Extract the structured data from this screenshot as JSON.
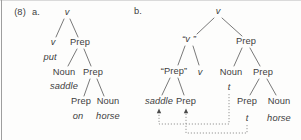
{
  "figure_label": {
    "text": "(8)",
    "x": 20,
    "y": 13
  },
  "colors": {
    "background": "#fdfdfc",
    "text": "#3e3e3e",
    "branch": "#6a6a6a",
    "movement_dotted": "#8a8a8a",
    "arrowhead": "#4a4a4a",
    "page_edge": "#9e9e9e",
    "top_edge": "#dadada"
  },
  "trees": [
    {
      "id": "a",
      "label": "a.",
      "label_x": 36,
      "label_y": 13,
      "nodes": [
        {
          "id": "v-root",
          "text": "v",
          "x": 67,
          "y": 13,
          "italic": true
        },
        {
          "id": "v-head",
          "text": "v",
          "x": 53,
          "y": 43,
          "italic": true
        },
        {
          "id": "prep-1",
          "text": "Prep",
          "x": 80,
          "y": 43,
          "italic": false
        },
        {
          "id": "put",
          "text": "put",
          "x": 50,
          "y": 58,
          "italic": true
        },
        {
          "id": "noun-1",
          "text": "Noun",
          "x": 64,
          "y": 73,
          "italic": false
        },
        {
          "id": "prep-2",
          "text": "Prep",
          "x": 93,
          "y": 73,
          "italic": false
        },
        {
          "id": "saddle",
          "text": "saddle",
          "x": 64,
          "y": 87,
          "italic": true
        },
        {
          "id": "prep-3",
          "text": "Prep",
          "x": 81,
          "y": 102,
          "italic": false
        },
        {
          "id": "noun-2",
          "text": "Noun",
          "x": 108,
          "y": 102,
          "italic": false
        },
        {
          "id": "on",
          "text": "on",
          "x": 78,
          "y": 117,
          "italic": true
        },
        {
          "id": "horse",
          "text": "horse",
          "x": 108,
          "y": 117,
          "italic": true
        }
      ],
      "edges": [
        [
          64,
          19,
          56,
          37
        ],
        [
          70,
          19,
          78,
          37
        ],
        [
          77,
          49,
          68,
          66
        ],
        [
          84,
          49,
          91,
          66
        ],
        [
          90,
          79,
          84,
          96
        ],
        [
          97,
          79,
          104,
          96
        ]
      ]
    },
    {
      "id": "b",
      "label": "b.",
      "label_x": 138,
      "label_y": 12,
      "nodes": [
        {
          "id": "v-root",
          "text": "v",
          "x": 218,
          "y": 12,
          "italic": true
        },
        {
          "id": "v-quoted",
          "text": "“v ”",
          "x": 189,
          "y": 40,
          "italic": true
        },
        {
          "id": "prep-top",
          "text": "Prep",
          "x": 246,
          "y": 42,
          "italic": false
        },
        {
          "id": "prep-quoted",
          "text": "“Prep”",
          "x": 174,
          "y": 72,
          "italic": false
        },
        {
          "id": "v-head",
          "text": "v",
          "x": 200,
          "y": 73,
          "italic": true
        },
        {
          "id": "noun-1",
          "text": "Noun",
          "x": 231,
          "y": 73,
          "italic": false
        },
        {
          "id": "prep-mid",
          "text": "Prep",
          "x": 263,
          "y": 73,
          "italic": false
        },
        {
          "id": "saddle",
          "text": "saddle",
          "x": 159,
          "y": 102,
          "italic": true
        },
        {
          "id": "prep-head",
          "text": "Prep",
          "x": 186,
          "y": 102,
          "italic": false
        },
        {
          "id": "trace-noun",
          "text": "t",
          "x": 229,
          "y": 88,
          "italic": true
        },
        {
          "id": "prep-low",
          "text": "Prep",
          "x": 247,
          "y": 102,
          "italic": false
        },
        {
          "id": "noun-low",
          "text": "Noun",
          "x": 279,
          "y": 102,
          "italic": false
        },
        {
          "id": "trace-prep",
          "text": "t",
          "x": 247,
          "y": 119,
          "italic": true
        },
        {
          "id": "horse",
          "text": "horse",
          "x": 279,
          "y": 119,
          "italic": true
        }
      ],
      "edges": [
        [
          214,
          18,
          197,
          34
        ],
        [
          222,
          18,
          242,
          36
        ],
        [
          185,
          46,
          178,
          65
        ],
        [
          193,
          46,
          199,
          65
        ],
        [
          170,
          78,
          162,
          95
        ],
        [
          178,
          78,
          184,
          95
        ],
        [
          242,
          48,
          234,
          66
        ],
        [
          250,
          48,
          260,
          66
        ],
        [
          259,
          79,
          250,
          95
        ],
        [
          267,
          79,
          276,
          95
        ]
      ]
    }
  ],
  "movement_arrows": [
    {
      "id": "noun-trace-to-saddle",
      "points": [
        [
          229,
          94
        ],
        [
          229,
          124
        ],
        [
          159,
          124
        ],
        [
          159,
          113
        ]
      ],
      "arrow_tip": [
        159,
        108.5
      ]
    },
    {
      "id": "prep-trace-to-prep-head",
      "points": [
        [
          247,
          125
        ],
        [
          247,
          133
        ],
        [
          186,
          133
        ],
        [
          186,
          113
        ]
      ],
      "arrow_tip": [
        186,
        108.5
      ]
    }
  ]
}
